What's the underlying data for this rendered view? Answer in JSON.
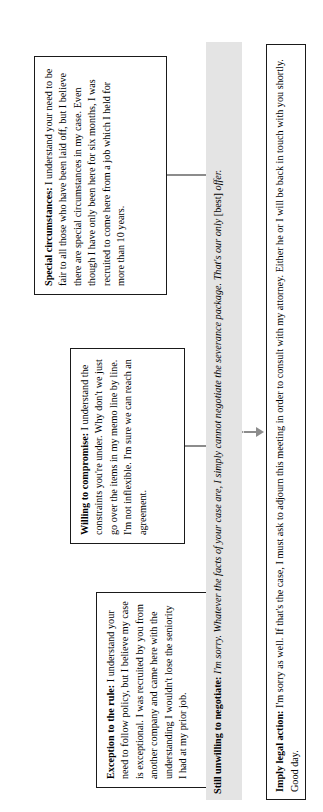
{
  "diagram": {
    "accent_color": "#8c8c8c",
    "shade_color": "#e4e4e4",
    "border_color": "#1a1a1a"
  },
  "nodes": {
    "exception": {
      "lead": "Exception to the rule:",
      "body": " I understand your need to follow policy, but I believe my case is exceptional. I was recruited by you from another company and came here with the understanding I wouldn't lose the seniority I had at my prior job."
    },
    "compromise": {
      "lead": "Willing to compromise:",
      "body": " I understand the constraints you're under. Why don't we just go over the items in my memo line by line. I'm not inflexible. I'm sure we can reach an agreement."
    },
    "special": {
      "lead": "Special circumstances:",
      "body": " I understand your need to be fair to all those who have been laid off, but I believe there are special circumstances in my case. Even though I have only been here for six months, I was recruited to come here from a job which I held for more than 10 years."
    },
    "unwilling": {
      "lead": "Still unwilling to negotiate:",
      "italic": " I'm sorry. Whatever the facts of your case are, I simply cannot negotiate the severance package. That's our only",
      "bracket": " [best] ",
      "italic_end": "offer."
    },
    "legal": {
      "lead": "Imply legal action:",
      "body": " I'm sorry as well. If that's the case, I must ask to adjourn this meeting in order to consult with my attorney. Either he or I will be back in touch with you shortly. Good day."
    }
  },
  "connectors": {
    "arrow_to_unwilling": "arrow-down",
    "arrow_to_legal": "arrow-down",
    "trunk": "horizontal-trunk"
  }
}
